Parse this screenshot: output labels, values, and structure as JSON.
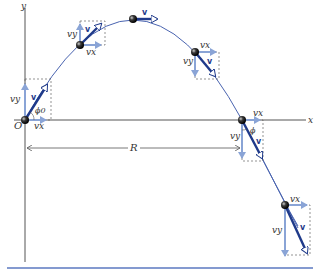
{
  "figure": {
    "type": "projectile-motion-diagram",
    "axes": {
      "x_label": "x",
      "y_label": "y",
      "origin_label": "O"
    },
    "range_label": "R",
    "launch_angle_label": "ϕ0",
    "impact_angle_label": "ϕ",
    "velocity_label": "v",
    "component_labels": {
      "horizontal": "vx",
      "vertical": "vy"
    },
    "points": [
      {
        "name": "launch",
        "vx_label": "vx",
        "vy_label": "vy",
        "v_label": "v"
      },
      {
        "name": "rising",
        "vx_label": "vx",
        "vy_label": "vy",
        "v_label": "v"
      },
      {
        "name": "apex",
        "v_label": "v"
      },
      {
        "name": "falling",
        "vx_label": "vx",
        "vy_label": "vy",
        "v_label": "v"
      },
      {
        "name": "return-to-launch-height",
        "vx_label": "vx",
        "vy_label": "vy",
        "v_label": "v"
      },
      {
        "name": "below-launch-height",
        "vx_label": "vx",
        "vy_label": "vy",
        "v_label": "v"
      }
    ],
    "colors": {
      "trajectory": "#4a64b0",
      "velocity_vector": "#1f3a8a",
      "component_vector": "#8aa4d6",
      "axes": "#555555",
      "dashed": "#666666",
      "bottom_rule": "#5b79c0"
    }
  }
}
